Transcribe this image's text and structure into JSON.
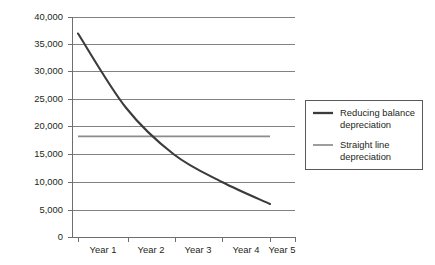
{
  "chart_data": {
    "type": "line",
    "title": "",
    "subtitle": "",
    "xlabel": "",
    "ylabel": "",
    "categories": [
      "Year 1",
      "Year 2",
      "Year 3",
      "Year 4",
      "Year 5"
    ],
    "ylim": [
      0,
      40000
    ],
    "yticks": [
      0,
      5000,
      10000,
      15000,
      20000,
      25000,
      30000,
      35000,
      40000
    ],
    "ytick_labels": [
      "0",
      "5,000",
      "10,000",
      "15,000",
      "20,000",
      "25,000",
      "30,000",
      "35,000",
      "40,000"
    ],
    "grid": "horizontal",
    "legend_position": "right",
    "series": [
      {
        "name": "Reducing balance depreciation",
        "legend_label_line1": "Reducing balance",
        "legend_label_line2": "depreciation",
        "color": "#3b3b3d",
        "values": [
          37000,
          23500,
          15000,
          10000,
          6000
        ]
      },
      {
        "name": "Straight line depreciation",
        "legend_label_line1": "Straight line",
        "legend_label_line2": "depreciation",
        "color": "#8a8c8e",
        "values": [
          18300,
          18300,
          18300,
          18300,
          18300
        ]
      }
    ]
  },
  "axes": {
    "y_labels": [
      "40,000",
      "35,000",
      "30,000",
      "25,000",
      "20,000",
      "15,000",
      "10,000",
      "5,000",
      "0"
    ],
    "x_labels": [
      "Year 1",
      "Year 2",
      "Year 3",
      "Year 4",
      "Year 5"
    ]
  },
  "legend": {
    "items": [
      {
        "line1": "Reducing balance",
        "line2": "depreciation"
      },
      {
        "line1": "Straight line",
        "line2": "depreciation"
      }
    ]
  },
  "colors": {
    "reducing_balance": "#3b3b3d",
    "straight_line": "#8a8c8e",
    "gridline": "#808285",
    "axis": "#6d6e71",
    "text": "#231f20",
    "background": "#ffffff"
  }
}
